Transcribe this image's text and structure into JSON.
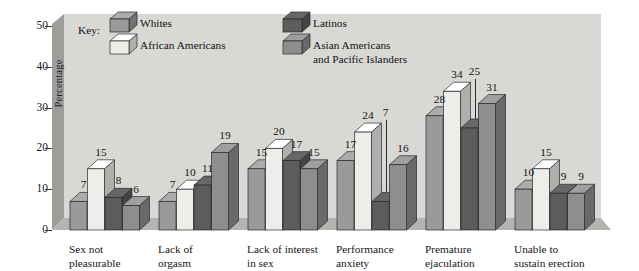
{
  "chart_data": {
    "type": "bar",
    "title": "",
    "xlabel": "",
    "ylabel": "Percentage",
    "ylim": [
      0,
      50
    ],
    "yticks": [
      0,
      10,
      20,
      30,
      40,
      50
    ],
    "grid": false,
    "legend_position": "top-inside",
    "legend_title": "Key:",
    "categories": [
      "Sex not\npleasurable",
      "Lack of\norgasm",
      "Lack of interest\nin sex",
      "Performance\nanxiety",
      "Premature\nejaculation",
      "Unable to\nsustain erection"
    ],
    "series": [
      {
        "name": "Whites",
        "color": "#9a9a9a",
        "values": [
          7,
          7,
          15,
          17,
          28,
          10
        ]
      },
      {
        "name": "African Americans",
        "color": "#ededea",
        "values": [
          15,
          10,
          20,
          24,
          34,
          15
        ]
      },
      {
        "name": "Latinos",
        "color": "#5c5c5c",
        "values": [
          8,
          11,
          17,
          7,
          25,
          9
        ]
      },
      {
        "name": "Asian Americans\nand Pacific Islanders",
        "color": "#8e8e8e",
        "values": [
          6,
          19,
          15,
          16,
          31,
          9
        ]
      }
    ]
  },
  "style": {
    "back_wall": "#d8d8d4",
    "side_wall": "#9d9d9a",
    "floor": "#b4b4b0",
    "outline": "#2a2a2a"
  }
}
